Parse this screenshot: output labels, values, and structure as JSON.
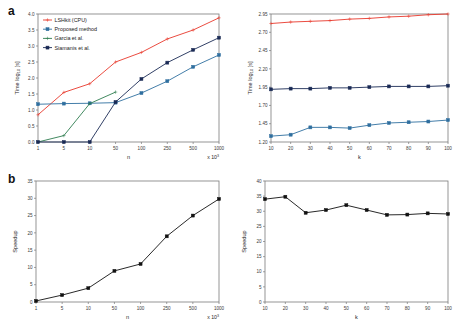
{
  "figure": {
    "panel_a_label": "a",
    "panel_b_label": "b"
  },
  "chart_data": [
    {
      "id": "a-left",
      "type": "line",
      "title": "",
      "xlabel": "n",
      "ylabel": "Time log10 [s]",
      "x_multiplier": "x 10",
      "x_multiplier_exp": "3",
      "categories": [
        "1",
        "5",
        "10",
        "50",
        "100",
        "250",
        "500",
        "1000"
      ],
      "ylim": [
        0.0,
        4.0
      ],
      "yticks": [
        "0.0",
        "0.5",
        "1.0",
        "1.5",
        "2.0",
        "2.5",
        "3.0",
        "3.5",
        "4.0"
      ],
      "ytick_values": [
        0.0,
        0.5,
        1.0,
        1.5,
        2.0,
        2.5,
        3.0,
        3.5,
        4.0
      ],
      "grid": false,
      "legend_position": "top-left",
      "series": [
        {
          "name": "LSHkit (CPU)",
          "color": "#e8382b",
          "marker": "plus",
          "values": [
            0.85,
            1.55,
            1.82,
            2.5,
            2.8,
            3.22,
            3.5,
            3.88
          ]
        },
        {
          "name": "Proposed method",
          "color": "#2f6f9f",
          "marker": "square",
          "values": [
            1.18,
            1.2,
            1.21,
            1.23,
            1.53,
            1.9,
            2.35,
            2.72
          ]
        },
        {
          "name": "Garcia et al.",
          "color": "#2e7d4f",
          "marker": "plus",
          "values": [
            0.0,
            0.2,
            1.2,
            1.56,
            null,
            null,
            null,
            null
          ]
        },
        {
          "name": "Siamanis et al.",
          "color": "#1a2a55",
          "marker": "square",
          "values": [
            0.0,
            0.0,
            0.0,
            1.25,
            1.97,
            2.48,
            2.88,
            3.26
          ]
        }
      ]
    },
    {
      "id": "a-right",
      "type": "line",
      "title": "",
      "xlabel": "k",
      "ylabel": "Time log10 [s]",
      "categories": [
        "10",
        "20",
        "30",
        "40",
        "50",
        "60",
        "70",
        "80",
        "90",
        "100"
      ],
      "ylim": [
        1.2,
        2.95
      ],
      "yticks": [
        "1.20",
        "1.45",
        "1.70",
        "1.95",
        "2.20",
        "2.45",
        "2.70",
        "2.95"
      ],
      "ytick_values": [
        1.2,
        1.45,
        1.7,
        1.95,
        2.2,
        2.45,
        2.7,
        2.95
      ],
      "grid": false,
      "legend_position": "none",
      "series": [
        {
          "name": "LSHkit (CPU)",
          "color": "#e8382b",
          "marker": "plus",
          "values": [
            2.82,
            2.84,
            2.85,
            2.86,
            2.88,
            2.89,
            2.91,
            2.92,
            2.94,
            2.95
          ]
        },
        {
          "name": "Siamanis et al.",
          "color": "#1a2a55",
          "marker": "square",
          "values": [
            1.92,
            1.93,
            1.93,
            1.94,
            1.94,
            1.95,
            1.96,
            1.96,
            1.96,
            1.97
          ]
        },
        {
          "name": "Proposed method",
          "color": "#2f6f9f",
          "marker": "square",
          "values": [
            1.28,
            1.3,
            1.4,
            1.4,
            1.39,
            1.43,
            1.46,
            1.47,
            1.48,
            1.5
          ]
        }
      ]
    },
    {
      "id": "b-left",
      "type": "line",
      "title": "",
      "xlabel": "n",
      "ylabel": "Speedup",
      "x_multiplier": "x 10",
      "x_multiplier_exp": "3",
      "categories": [
        "1",
        "5",
        "10",
        "50",
        "100",
        "250",
        "500",
        "1000"
      ],
      "ylim": [
        0,
        35
      ],
      "yticks": [
        "0",
        "5",
        "10",
        "15",
        "20",
        "25",
        "30",
        "35"
      ],
      "ytick_values": [
        0,
        5,
        10,
        15,
        20,
        25,
        30,
        35
      ],
      "grid": false,
      "legend_position": "none",
      "series": [
        {
          "name": "Speedup",
          "color": "#111111",
          "marker": "square",
          "values": [
            0.3,
            2.0,
            4.0,
            9.0,
            11.0,
            19.0,
            25.0,
            29.8
          ]
        }
      ]
    },
    {
      "id": "b-right",
      "type": "line",
      "title": "",
      "xlabel": "k",
      "ylabel": "Speedup",
      "categories": [
        "10",
        "20",
        "30",
        "40",
        "50",
        "60",
        "70",
        "80",
        "90",
        "100"
      ],
      "ylim": [
        0,
        40
      ],
      "yticks": [
        "0",
        "5",
        "10",
        "15",
        "20",
        "25",
        "30",
        "35",
        "40"
      ],
      "ytick_values": [
        0,
        5,
        10,
        15,
        20,
        25,
        30,
        35,
        40
      ],
      "grid": false,
      "legend_position": "none",
      "series": [
        {
          "name": "Speedup",
          "color": "#111111",
          "marker": "square",
          "values": [
            34.0,
            34.8,
            29.5,
            30.4,
            32.0,
            30.4,
            28.8,
            28.9,
            29.3,
            29.1
          ]
        }
      ]
    }
  ]
}
